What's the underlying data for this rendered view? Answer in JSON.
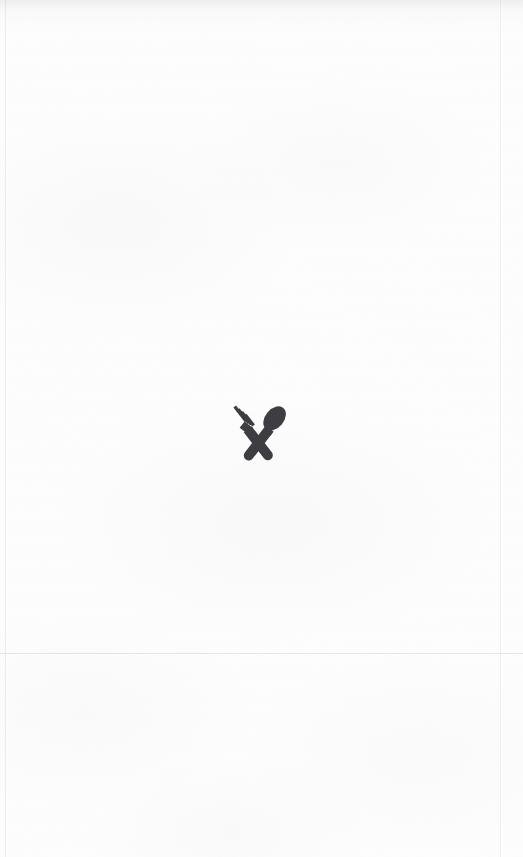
{
  "page": {
    "background_color": "#fdfdfd",
    "width": 523,
    "height": 857,
    "surface": "scanned-paper",
    "caption": ""
  },
  "logo": {
    "icon_name": "fork-and-spoon-crossed-icon",
    "label": "Restaurant",
    "color": "#3d3d42",
    "x": 226,
    "y": 399,
    "width": 65,
    "height": 64
  },
  "marks": {
    "horizontal_seam_y": 653,
    "left_seam_x": 5,
    "right_seam_x": 500,
    "seam_color": "#8c8e94"
  }
}
